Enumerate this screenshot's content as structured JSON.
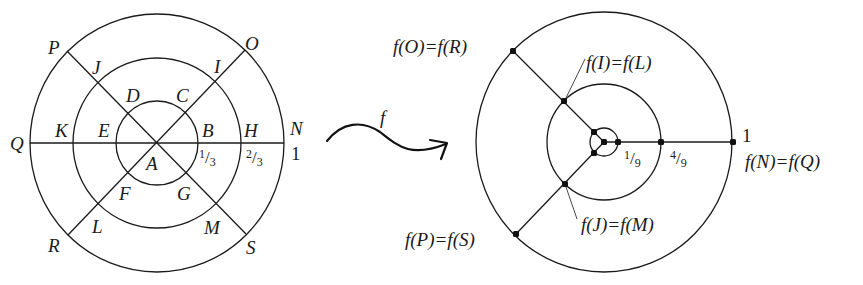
{
  "colors": {
    "ink": "#1a1a1a",
    "background": "#ffffff"
  },
  "left_diagram": {
    "name": "domain-disk",
    "center": [
      157,
      143
    ],
    "circles": [
      {
        "name": "outer-circle",
        "rx": 127,
        "ry": 129
      },
      {
        "name": "middle-circle",
        "rx": 84,
        "ry": 85
      },
      {
        "name": "inner-circle",
        "rx": 41,
        "ry": 42
      }
    ],
    "lines": [
      {
        "name": "horizontal-diameter-QN",
        "x1": 30,
        "y1": 143,
        "x2": 284,
        "y2": 143
      },
      {
        "name": "diagonal-PS",
        "x1": 67,
        "y1": 51,
        "x2": 246,
        "y2": 234
      },
      {
        "name": "diagonal-RO",
        "x1": 68,
        "y1": 235,
        "x2": 245,
        "y2": 50
      }
    ],
    "labels": [
      {
        "text": "P",
        "x": 48,
        "y": 54
      },
      {
        "text": "O",
        "x": 245,
        "y": 50
      },
      {
        "text": "J",
        "x": 92,
        "y": 74
      },
      {
        "text": "I",
        "x": 214,
        "y": 73
      },
      {
        "text": "D",
        "x": 126,
        "y": 102
      },
      {
        "text": "C",
        "x": 176,
        "y": 102
      },
      {
        "text": "Q",
        "x": 10,
        "y": 150
      },
      {
        "text": "K",
        "x": 55,
        "y": 137
      },
      {
        "text": "E",
        "x": 98,
        "y": 137
      },
      {
        "text": "B",
        "x": 202,
        "y": 137
      },
      {
        "text": "H",
        "x": 244,
        "y": 137
      },
      {
        "text": "N",
        "x": 290,
        "y": 135
      },
      {
        "text": "A",
        "x": 146,
        "y": 170
      },
      {
        "text": "F",
        "x": 119,
        "y": 200
      },
      {
        "text": "G",
        "x": 177,
        "y": 200
      },
      {
        "text": "L",
        "x": 92,
        "y": 233
      },
      {
        "text": "M",
        "x": 204,
        "y": 234
      },
      {
        "text": "R",
        "x": 48,
        "y": 252
      },
      {
        "text": "S",
        "x": 246,
        "y": 254
      }
    ],
    "numbers": [
      {
        "text": "1",
        "x": 291,
        "y": 160,
        "kind": "num"
      }
    ],
    "fractions": [
      {
        "num": "1",
        "den": "3",
        "x": 199,
        "y": 163
      },
      {
        "num": "2",
        "den": "3",
        "x": 246,
        "y": 163
      }
    ]
  },
  "mapping_arrow": {
    "label": "f",
    "label_x": 380,
    "label_y": 124,
    "path": "M 327 141 C 342 122, 362 120, 380 132 C 398 146, 410 158, 446 144",
    "head": "M 430 140 L 447 143 L 441 159"
  },
  "right_diagram": {
    "name": "image-disk",
    "center": [
      604,
      142
    ],
    "circles": [
      {
        "name": "outer-circle",
        "rx": 128,
        "ry": 130
      },
      {
        "name": "middle-circle",
        "rx": 57,
        "ry": 58
      },
      {
        "name": "inner-circle",
        "rx": 14,
        "ry": 14
      }
    ],
    "lines": [
      {
        "name": "ray-to-fN",
        "x1": 604,
        "y1": 142,
        "x2": 733,
        "y2": 142
      },
      {
        "name": "ray-to-fO",
        "x1": 604,
        "y1": 142,
        "x2": 513,
        "y2": 51
      },
      {
        "name": "ray-to-fP",
        "x1": 604,
        "y1": 142,
        "x2": 516,
        "y2": 234
      }
    ],
    "leaders": [
      {
        "name": "leader-fI",
        "x1": 565,
        "y1": 100,
        "x2": 585,
        "y2": 59
      },
      {
        "name": "leader-fJ",
        "x1": 566,
        "y1": 187,
        "x2": 577,
        "y2": 219
      }
    ],
    "dots": [
      {
        "name": "dot-center",
        "x": 604,
        "y": 142
      },
      {
        "name": "dot-1-9",
        "x": 618,
        "y": 142
      },
      {
        "name": "dot-4-9",
        "x": 661,
        "y": 142
      },
      {
        "name": "dot-fN",
        "x": 733,
        "y": 142
      },
      {
        "name": "dot-inner-upper",
        "x": 594,
        "y": 132
      },
      {
        "name": "dot-inner-lower",
        "x": 594,
        "y": 153
      },
      {
        "name": "dot-fI",
        "x": 564,
        "y": 101
      },
      {
        "name": "dot-fJ",
        "x": 565,
        "y": 184
      },
      {
        "name": "dot-fO",
        "x": 513,
        "y": 51
      },
      {
        "name": "dot-fP",
        "x": 516,
        "y": 234
      }
    ],
    "labels": [
      {
        "text": "f(O)=f(R)",
        "x": 393,
        "y": 53,
        "name": "label-fO-fR"
      },
      {
        "text": "f(I)=f(L)",
        "x": 586,
        "y": 69,
        "name": "label-fI-fL"
      },
      {
        "text": "f(J)=f(M)",
        "x": 581,
        "y": 231,
        "name": "label-fJ-fM"
      },
      {
        "text": "f(P)=f(S)",
        "x": 405,
        "y": 246,
        "name": "label-fP-fS"
      },
      {
        "text": "f(N)=f(Q)",
        "x": 745,
        "y": 168,
        "name": "label-fN-fQ"
      }
    ],
    "numbers": [
      {
        "text": "1",
        "x": 742,
        "y": 142,
        "kind": "num"
      }
    ],
    "fractions": [
      {
        "num": "1",
        "den": "9",
        "x": 624,
        "y": 164
      },
      {
        "num": "4",
        "den": "9",
        "x": 670,
        "y": 164
      }
    ]
  }
}
